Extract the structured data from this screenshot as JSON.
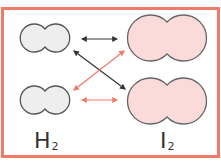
{
  "diagram": {
    "frame_color": "#f07a68",
    "molecules": {
      "h2": {
        "formula": "H",
        "subscript": "2",
        "fill": "#eeeeee",
        "stroke": "#555555"
      },
      "i2": {
        "formula": "I",
        "subscript": "2",
        "fill": "#fbdada",
        "stroke": "#666666"
      }
    },
    "arrows": [
      {
        "from": "H2 top",
        "to": "I2 top",
        "color": "#333333",
        "type": "double-headed"
      },
      {
        "from": "H2 top",
        "to": "I2 bottom",
        "color": "#333333",
        "type": "double-headed"
      },
      {
        "from": "H2 bottom",
        "to": "I2 top",
        "color": "#f07a68",
        "type": "double-headed"
      },
      {
        "from": "H2 bottom",
        "to": "I2 bottom",
        "color": "#f07a68",
        "type": "double-headed"
      }
    ],
    "labels": {
      "h2": "H",
      "h2_sub": "2",
      "i2": "I",
      "i2_sub": "2"
    }
  }
}
